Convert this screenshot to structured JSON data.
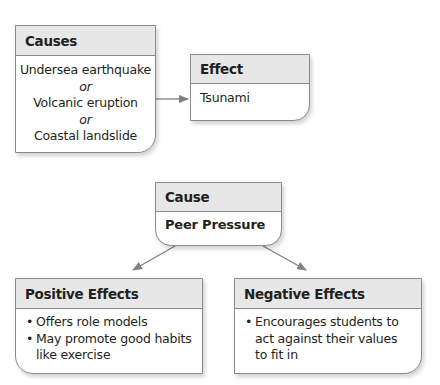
{
  "diagram1": {
    "causes": {
      "title": "Causes",
      "items": [
        "Undersea earthquake",
        "or",
        "Volcanic eruption",
        "or",
        "Coastal landslide"
      ]
    },
    "effect": {
      "title": "Effect",
      "text": "Tsunami"
    }
  },
  "diagram2": {
    "cause": {
      "title": "Cause",
      "text": "Peer Pressure"
    },
    "positive": {
      "title": "Positive Effects",
      "items": [
        "Offers role models",
        "May promote good habits like exercise"
      ]
    },
    "negative": {
      "title": "Negative Effects",
      "items": [
        "Encourages students to act against their values to fit in"
      ]
    }
  },
  "colors": {
    "header_fill": "#e7e7e8",
    "border": "#8a8a8a",
    "arrow": "#808080",
    "text": "#231f20"
  }
}
